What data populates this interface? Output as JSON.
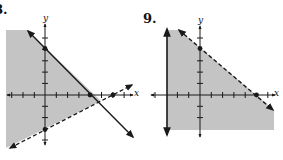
{
  "graphs": [
    {
      "label": "8.",
      "axis_x_label": "x",
      "axis_y_label": "y",
      "lines": [
        {
          "equation": "x + y = 4",
          "style": "solid",
          "points": [
            [
              4,
              0
            ],
            [
              0,
              4
            ]
          ]
        },
        {
          "equation": "y = x/2 - 3",
          "style": "dashed",
          "points": [
            [
              6,
              0
            ],
            [
              0,
              -3
            ]
          ]
        }
      ],
      "shaded_region": "x + y <= 4 and y > x/2 - 3"
    },
    {
      "label": "9.",
      "axis_x_label": "x",
      "axis_y_label": "y",
      "lines": [
        {
          "equation": "x = -3",
          "style": "solid",
          "points": []
        },
        {
          "equation": "4x + 5y = 20",
          "style": "dashed",
          "points": [
            [
              5,
              0
            ],
            [
              0,
              4
            ]
          ]
        }
      ],
      "shaded_region": "x >= -3 and 4x + 5y < 20"
    }
  ],
  "colors": {
    "shade": "#c4c4c4",
    "line": "#1a1a1a",
    "background": "#ffffff"
  }
}
